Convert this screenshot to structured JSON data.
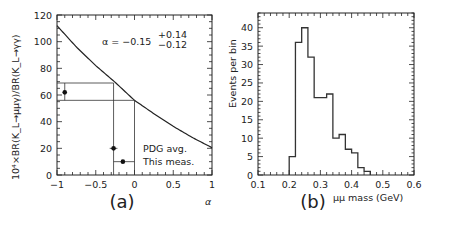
{
  "chart_data": [
    {
      "type": "line",
      "panel_label": "(a)",
      "xlabel": "α",
      "ylabel": "10⁴×BR(K_L→μμγ)/BR(K_L→γγ)",
      "xlim": [
        -1,
        1
      ],
      "ylim": [
        0,
        120
      ],
      "xticks": [
        -1,
        -0.5,
        0,
        0.5,
        1
      ],
      "xtick_labels": [
        "−1",
        "−0.5",
        "0",
        "0.5",
        "1"
      ],
      "yticks": [
        0,
        20,
        40,
        60,
        80,
        100,
        120
      ],
      "annotation": {
        "text": "α = −0.15",
        "sup": "+0.14",
        "sub": "−0.12"
      },
      "curve": {
        "x": [
          -1,
          -0.75,
          -0.5,
          -0.25,
          0,
          0.25,
          0.5,
          0.75,
          1
        ],
        "y": [
          112,
          96,
          82,
          69.5,
          56,
          46,
          36.5,
          28,
          20.5
        ]
      },
      "guide_lines": {
        "y_values": [
          69,
          56
        ],
        "x_values": [
          -0.27,
          0
        ]
      },
      "points": [
        {
          "name": "ratio measurement",
          "x": -0.9,
          "y": 62,
          "yerr": [
            56,
            69
          ]
        },
        {
          "name": "PDG avg.",
          "x": -0.27,
          "y": 20,
          "xerr": [
            -0.32,
            -0.22
          ]
        },
        {
          "name": "This meas.",
          "x": -0.15,
          "y": 10,
          "xerr": [
            -0.27,
            0
          ]
        }
      ],
      "legend": [
        "PDG avg.",
        "This meas."
      ]
    },
    {
      "type": "bar",
      "panel_label": "(b)",
      "xlabel": "μμ mass (GeV)",
      "ylabel": "Events per bin",
      "xlim": [
        0.1,
        0.6
      ],
      "ylim": [
        0,
        44
      ],
      "xticks": [
        0.1,
        0.2,
        0.3,
        0.4,
        0.5,
        0.6
      ],
      "yticks": [
        0,
        5,
        10,
        15,
        20,
        25,
        30,
        35,
        40
      ],
      "bin_edges": [
        0.2,
        0.22,
        0.24,
        0.26,
        0.28,
        0.3,
        0.32,
        0.34,
        0.36,
        0.38,
        0.4,
        0.42,
        0.44,
        0.46
      ],
      "values": [
        5,
        36,
        40,
        32,
        21,
        21,
        22,
        10,
        11,
        7,
        6,
        2,
        1
      ]
    }
  ]
}
